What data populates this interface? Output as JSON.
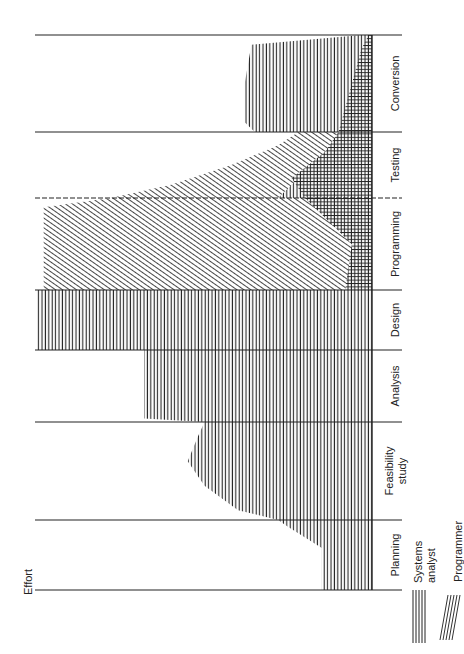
{
  "chart_data": {
    "type": "area",
    "title": "",
    "orientation": "rotated-90-ccw",
    "ylabel": "Effort",
    "xlabel": "",
    "categories": [
      "Planning",
      "Feasibility study",
      "Analysis",
      "Design",
      "Programming",
      "Testing",
      "Conversion"
    ],
    "grid": true,
    "series": [
      {
        "name": "Systems analyst",
        "pattern": "vertical-lines",
        "values": [
          15,
          55,
          68,
          100,
          5,
          25,
          35
        ],
        "profile": [
          [
            0,
            15
          ],
          [
            0.6,
            15
          ],
          [
            0.9,
            25
          ],
          [
            1.0,
            28
          ],
          [
            1.1,
            40
          ],
          [
            1.35,
            50
          ],
          [
            1.6,
            55
          ],
          [
            1.85,
            52
          ],
          [
            2.0,
            50
          ],
          [
            2.05,
            68
          ],
          [
            2.3,
            68
          ],
          [
            2.8,
            68
          ],
          [
            3.0,
            68
          ],
          [
            3.0,
            100
          ],
          [
            4.0,
            100
          ],
          [
            4.0,
            5
          ],
          [
            4.5,
            4
          ],
          [
            5.0,
            8
          ],
          [
            5.0,
            28
          ],
          [
            5.3,
            22
          ],
          [
            5.8,
            8
          ],
          [
            6.0,
            8
          ],
          [
            6.0,
            35
          ],
          [
            6.1,
            38
          ],
          [
            6.5,
            38
          ],
          [
            6.9,
            36
          ],
          [
            7.0,
            3
          ]
        ]
      },
      {
        "name": "Programmer",
        "pattern": "diagonal-lines",
        "values": [
          0,
          0,
          0,
          0,
          98,
          45,
          15
        ],
        "profile": [
          [
            4.0,
            98
          ],
          [
            4.9,
            98
          ],
          [
            5.0,
            78
          ],
          [
            5.2,
            60
          ],
          [
            5.5,
            42
          ],
          [
            5.8,
            28
          ],
          [
            6.0,
            22
          ],
          [
            6.4,
            10
          ],
          [
            6.8,
            4
          ],
          [
            7.0,
            1
          ]
        ]
      }
    ],
    "ylim": [
      0,
      100
    ],
    "legend": {
      "position": "bottom-right",
      "entries": [
        {
          "label": "Systems analyst",
          "pattern": "vertical-lines"
        },
        {
          "label": "Programmer",
          "pattern": "diagonal-lines"
        }
      ]
    }
  },
  "axis": {
    "effort_label": "Effort"
  },
  "phases": [
    {
      "label": "Planning"
    },
    {
      "label": "Feasibility",
      "label2": "study"
    },
    {
      "label": "Analysis"
    },
    {
      "label": "Design"
    },
    {
      "label": "Programming"
    },
    {
      "label": "Testing"
    },
    {
      "label": "Conversion"
    }
  ],
  "legend": {
    "systems_analyst_1": "Systems",
    "systems_analyst_2": "analyst",
    "programmer": "Programmer"
  },
  "colors": {
    "ink": "#222222",
    "background": "#ffffff"
  }
}
